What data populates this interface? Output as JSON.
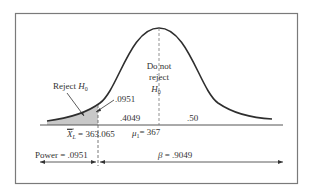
{
  "diagram": {
    "type": "normal-distribution-hypothesis-test",
    "colors": {
      "frame": "#7a7a7a",
      "curve": "#2e2e2e",
      "axis": "#555555",
      "shade": "#c8c8c8",
      "text": "#333333"
    },
    "labels": {
      "reject_region": "Reject ",
      "reject_h": "H",
      "reject_sub": "0",
      "do_not_line1": "Do not",
      "do_not_line2": "reject",
      "do_not_h": "H",
      "do_not_sub": "0",
      "tail_area": ".0951",
      "middle_left_area": ".4049",
      "right_half_area": ".50",
      "critical_value_symbol": "X",
      "critical_value_sub": "L",
      "critical_value_text": " = 363.065",
      "mean_symbol": "μ",
      "mean_sub": "1",
      "mean_text": "= 367",
      "power_label": "Power = .0951",
      "beta_symbol": "β",
      "beta_text": " = .9049"
    },
    "values": {
      "critical_value": 363.065,
      "mu1": 367,
      "power": 0.0951,
      "beta": 0.9049,
      "tail_area": 0.0951,
      "middle_left_area": 0.4049,
      "right_half_area": 0.5
    }
  }
}
